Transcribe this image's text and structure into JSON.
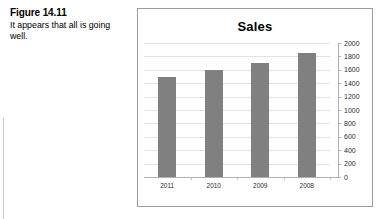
{
  "figure": {
    "label": "Figure 14.11",
    "caption": "It appears that all is going well."
  },
  "chart_data": {
    "type": "bar",
    "title": "Sales",
    "xlabel": "",
    "ylabel": "",
    "categories": [
      "2011",
      "2010",
      "2009",
      "2008"
    ],
    "values": [
      1500,
      1600,
      1700,
      1850
    ],
    "series": [
      {
        "name": "Sales",
        "values": [
          1500,
          1600,
          1700,
          1850
        ]
      }
    ],
    "ylim": [
      0,
      2000
    ],
    "ytick_step": 200,
    "yticks": [
      "2000",
      "1800",
      "1600",
      "1400",
      "1200",
      "1000",
      "800",
      "600",
      "400",
      "200",
      "0"
    ],
    "grid": true,
    "legend": "none",
    "y_axis_position": "right",
    "bar_color": "#808080",
    "gridline_color": "#e2e2e2",
    "axis_color": "#b0b0b0",
    "frame_color": "#9c9c9c"
  }
}
